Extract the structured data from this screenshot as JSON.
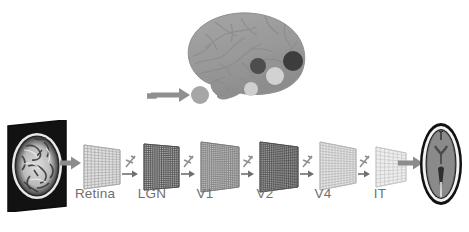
{
  "figure": {
    "background_color": "#ffffff"
  },
  "top_panel": {
    "name": "brain-with-roi-markers",
    "arrow_label": "input-arrow",
    "brain_color": "#9a9a9a",
    "brain_outline_color": "#8a8a8a",
    "markers": [
      {
        "name": "roi-marker-retina",
        "color": "#a8a8a8",
        "cx": 23,
        "cy": 92,
        "r": 9
      },
      {
        "name": "roi-marker-lgn",
        "color": "#c9c9c9",
        "cx": 73,
        "cy": 86,
        "r": 7
      },
      {
        "name": "roi-marker-v1",
        "color": "#4a4a4a",
        "cx": 92,
        "cy": 63,
        "r": 8
      },
      {
        "name": "roi-marker-v2",
        "color": "#cfcfcf",
        "cx": 110,
        "cy": 72,
        "r": 9
      },
      {
        "name": "roi-marker-v4",
        "color": "#3a3a3a",
        "cx": 130,
        "cy": 58,
        "r": 10
      }
    ]
  },
  "pipeline": {
    "input": {
      "name": "input-mri-slice",
      "alt": "sagittal brain MRI slice in dark frame"
    },
    "output": {
      "name": "output-brain-section",
      "alt": "axial brain cross-section"
    },
    "connector_icon": "cut-slash-icon",
    "arrow_icon": "right-arrow-icon",
    "layers": [
      {
        "label": "Retina",
        "name": "layer-retina",
        "left": 80,
        "label_left": 66,
        "label_width": 58,
        "w": 36,
        "h_left": 44,
        "h_right": 34,
        "rows": 14,
        "cols": 10,
        "shade": "#c8c8c8",
        "line": "#a9a9a9",
        "density": 1
      },
      {
        "label": "LGN",
        "name": "layer-lgn",
        "left": 140,
        "label_left": 128,
        "label_width": 48,
        "w": 35,
        "h_left": 46,
        "h_right": 40,
        "rows": 22,
        "cols": 16,
        "shade": "#7d7d7d",
        "line": "#4e4e4e",
        "density": 2
      },
      {
        "label": "V1",
        "name": "layer-v1",
        "left": 197,
        "label_left": 188,
        "label_width": 34,
        "w": 38,
        "h_left": 50,
        "h_right": 40,
        "rows": 24,
        "cols": 18,
        "shade": "#9d9d9d",
        "line": "#7d7d7d",
        "density": 2
      },
      {
        "label": "V2",
        "name": "layer-v2",
        "left": 256,
        "label_left": 248,
        "label_width": 34,
        "w": 38,
        "h_left": 50,
        "h_right": 40,
        "rows": 26,
        "cols": 20,
        "shade": "#7a7a7a",
        "line": "#4e4e4e",
        "density": 2
      },
      {
        "label": "V4",
        "name": "layer-v4",
        "left": 316,
        "label_left": 306,
        "label_width": 34,
        "w": 36,
        "h_left": 48,
        "h_right": 34,
        "rows": 16,
        "cols": 12,
        "shade": "#d2d2d2",
        "line": "#b4b4b4",
        "density": 1
      },
      {
        "label": "IT",
        "name": "layer-it",
        "left": 372,
        "label_left": 366,
        "label_width": 28,
        "w": 30,
        "h_left": 40,
        "h_right": 28,
        "rows": 10,
        "cols": 7,
        "shade": "#e0e0e0",
        "line": "#c6c6c6",
        "density": 1
      }
    ]
  },
  "colors": {
    "text": "#6f6f6f",
    "arrow": "#8c8c8c",
    "thin_arrow": "#707070",
    "frame_dark": "#151515"
  }
}
